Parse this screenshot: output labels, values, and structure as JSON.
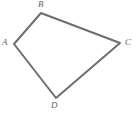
{
  "figure": {
    "kind": "geometry-diagram",
    "shape_name": "quadrilateral",
    "background_color": "#ffffff",
    "stroke_color": "#6e6e72",
    "stroke_width": 2,
    "label_color": "#5f5f5f",
    "canvas": {
      "width": 139,
      "height": 118
    },
    "vertices": [
      {
        "id": "A",
        "label": "A",
        "x": 14,
        "y": 44,
        "label_x": 2,
        "label_y": 38
      },
      {
        "id": "B",
        "label": "B",
        "x": 41,
        "y": 13,
        "label_x": 38,
        "label_y": 0
      },
      {
        "id": "C",
        "label": "C",
        "x": 120,
        "y": 43,
        "label_x": 125,
        "label_y": 38
      },
      {
        "id": "D",
        "label": "D",
        "x": 56,
        "y": 98,
        "label_x": 51,
        "label_y": 101
      }
    ],
    "edges": [
      {
        "from": "A",
        "to": "B"
      },
      {
        "from": "B",
        "to": "C"
      },
      {
        "from": "C",
        "to": "D"
      },
      {
        "from": "D",
        "to": "A"
      }
    ],
    "polygon_points": "14,44 41,13 120,43 56,98"
  }
}
